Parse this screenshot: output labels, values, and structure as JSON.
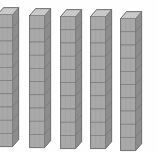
{
  "scene": {
    "title": "Base ten rods",
    "description": "Five vertical base-ten tens-rods shown in isometric view on a white background",
    "background_color": "#fefefe",
    "width": 158,
    "height": 152
  },
  "manipulative": {
    "kind": "base-ten-rods",
    "rod_count": 5,
    "cubes_per_rod": 10,
    "total_units": 50,
    "unit_value_per_rod": 10,
    "colors": {
      "front_face": "#a9a9a9",
      "side_face": "#8d8d8d",
      "top_face": "#c9c9c9",
      "outline": "#6b6b6b"
    }
  },
  "rods": [
    {
      "index": 1,
      "label": "rod-1",
      "value": 10,
      "cubes": 10,
      "left": -3,
      "top": 7,
      "front_width": 15,
      "cube_height": 13.2,
      "depth_x": 6,
      "depth_y": 7,
      "clipped": "left"
    },
    {
      "index": 2,
      "label": "rod-2",
      "value": 10,
      "cubes": 10,
      "left": 29,
      "top": 8,
      "front_width": 15,
      "cube_height": 13.2,
      "depth_x": 6,
      "depth_y": 7,
      "clipped": "none"
    },
    {
      "index": 3,
      "label": "rod-3",
      "value": 10,
      "cubes": 10,
      "left": 60,
      "top": 9,
      "front_width": 15,
      "cube_height": 13.2,
      "depth_x": 6,
      "depth_y": 7,
      "clipped": "none"
    },
    {
      "index": 4,
      "label": "rod-4",
      "value": 10,
      "cubes": 10,
      "left": 90,
      "top": 9,
      "front_width": 15,
      "cube_height": 13.2,
      "depth_x": 6,
      "depth_y": 7,
      "clipped": "none"
    },
    {
      "index": 5,
      "label": "rod-5",
      "value": 10,
      "cubes": 10,
      "left": 120,
      "top": 11,
      "front_width": 15,
      "cube_height": 13.2,
      "depth_x": 6,
      "depth_y": 7,
      "clipped": "none"
    }
  ]
}
